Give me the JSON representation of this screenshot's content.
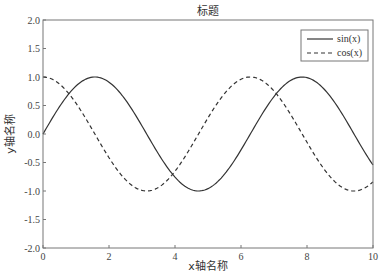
{
  "chart_data": {
    "type": "line",
    "title": "标题",
    "xlabel": "x轴名称",
    "ylabel": "y轴名称",
    "xlim": [
      0,
      10
    ],
    "ylim": [
      -2.0,
      2.0
    ],
    "x_ticks": [
      "0",
      "2",
      "4",
      "6",
      "8",
      "10"
    ],
    "y_ticks": [
      "2.0",
      "1.5",
      "1.0",
      "0.5",
      "0.0",
      "-0.5",
      "-1.0",
      "-1.5",
      "-2.0"
    ],
    "grid": false,
    "legend_position": "upper right",
    "series": [
      {
        "name": "sin(x)",
        "function": "sin",
        "line_style": "solid",
        "color": "#333333",
        "x": [
          0,
          1,
          1.57,
          2,
          3,
          4,
          4.71,
          5,
          6,
          7,
          7.85,
          8,
          9,
          10
        ],
        "values": [
          0.0,
          0.84,
          1.0,
          0.91,
          0.14,
          -0.76,
          -1.0,
          -0.96,
          -0.28,
          0.66,
          1.0,
          0.99,
          0.41,
          -0.54
        ]
      },
      {
        "name": "cos(x)",
        "function": "cos",
        "line_style": "dashed",
        "color": "#333333",
        "x": [
          0,
          1,
          2,
          3,
          3.14,
          4,
          5,
          6,
          6.28,
          7,
          8,
          9,
          9.42,
          10
        ],
        "values": [
          1.0,
          0.54,
          -0.42,
          -0.99,
          -1.0,
          -0.65,
          0.28,
          0.96,
          1.0,
          0.75,
          -0.15,
          -0.91,
          -1.0,
          -0.84
        ]
      }
    ]
  },
  "legend": {
    "items": [
      {
        "label": "sin(x)",
        "style": "solid"
      },
      {
        "label": "cos(x)",
        "style": "dashed"
      }
    ]
  },
  "colors": {
    "frame": "#777777",
    "line": "#333333",
    "text": "#444444"
  }
}
